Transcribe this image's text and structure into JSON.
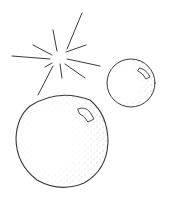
{
  "illustration": {
    "subject": "Two stippled spheres with a sparkle",
    "colors": {
      "background": "#ffffff",
      "ink": "#3a3a3a",
      "stipple": "#6b6b6b"
    },
    "sparkle": {
      "cx": 58,
      "cy": 58
    },
    "small_sphere": {
      "cx": 131,
      "cy": 83,
      "r": 24
    },
    "large_sphere": {
      "cx": 62,
      "cy": 139,
      "r": 46
    }
  }
}
